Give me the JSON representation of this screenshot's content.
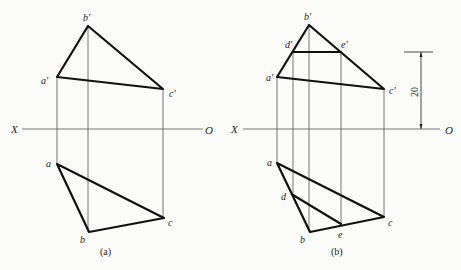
{
  "figure_a": {
    "caption": "(a)",
    "axis": {
      "left_label": "X",
      "right_label": "O"
    },
    "front_view": {
      "points": {
        "a'": [
          57,
          77
        ],
        "b'": [
          88,
          26
        ],
        "c'": [
          163,
          89
        ]
      },
      "labels": {
        "a_prime": "a'",
        "b_prime": "b'",
        "c_prime": "c'"
      }
    },
    "top_view": {
      "points": {
        "a": [
          57,
          164
        ],
        "b": [
          89,
          232
        ],
        "c": [
          164,
          218
        ]
      },
      "labels": {
        "a": "a",
        "b": "b",
        "c": "c"
      }
    }
  },
  "figure_b": {
    "caption": "(b)",
    "axis": {
      "left_label": "X",
      "right_label": "O"
    },
    "front_view": {
      "points": {
        "a'": [
          277,
          77
        ],
        "b'": [
          309,
          25
        ],
        "c'": [
          384,
          89
        ],
        "d'": [
          293,
          52
        ],
        "e'": [
          341,
          52
        ]
      },
      "labels": {
        "a_prime": "a'",
        "b_prime": "b'",
        "c_prime": "c'",
        "d_prime": "d'",
        "e_prime": "e'"
      }
    },
    "top_view": {
      "points": {
        "a": [
          277,
          163
        ],
        "b": [
          310,
          232
        ],
        "c": [
          384,
          217
        ],
        "d": [
          293,
          195
        ],
        "e": [
          341,
          224
        ]
      },
      "labels": {
        "a": "a",
        "b": "b",
        "c": "c",
        "d": "d",
        "e": "e"
      }
    },
    "dimension": {
      "value": "20"
    }
  }
}
